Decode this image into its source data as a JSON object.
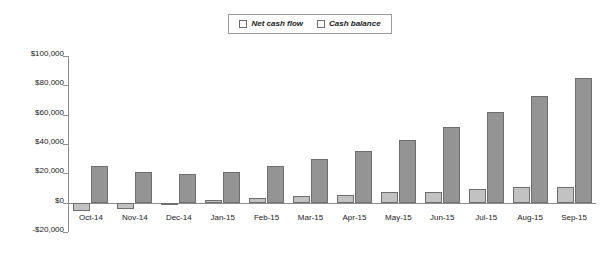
{
  "chart_data": {
    "type": "bar",
    "title": "",
    "xlabel": "",
    "ylabel": "",
    "ylim": [
      -20000,
      100000
    ],
    "grid": false,
    "legend_position": "top-center",
    "categories": [
      "Oct-14",
      "Nov-14",
      "Dec-14",
      "Jan-15",
      "Feb-15",
      "Mar-15",
      "Apr-15",
      "May-15",
      "Jun-15",
      "Jul-15",
      "Aug-15",
      "Sep-15"
    ],
    "ytick_labels": [
      "$100,000",
      "$80,000",
      "$60,000",
      "$40,000",
      "$20,000",
      "$0",
      "-$20,000"
    ],
    "ytick_values": [
      100000,
      80000,
      60000,
      40000,
      20000,
      0,
      -20000
    ],
    "series": [
      {
        "name": "Net cash flow",
        "color": "#c2c2c2",
        "values": [
          -5500,
          -4000,
          -1500,
          1500,
          3500,
          4500,
          5000,
          7000,
          7500,
          9500,
          11000,
          11000
        ]
      },
      {
        "name": "Cash balance",
        "color": "#949494",
        "values": [
          25000,
          21000,
          19500,
          21000,
          25000,
          30000,
          35500,
          43000,
          51500,
          61500,
          73000,
          85000
        ]
      }
    ]
  },
  "legend": {
    "entries": [
      {
        "label": "Net cash flow"
      },
      {
        "label": "Cash balance"
      }
    ]
  }
}
